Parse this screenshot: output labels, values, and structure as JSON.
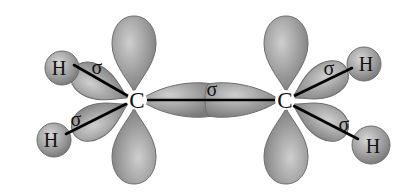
{
  "diagram": {
    "atoms": {
      "carbon_left": "C",
      "carbon_right": "C",
      "h_left_top": "H",
      "h_left_bottom": "H",
      "h_right_top": "H",
      "h_right_bottom": "H"
    },
    "bond_labels": {
      "sigma_left_top": "σ",
      "sigma_left_bottom": "σ",
      "sigma_cc": "σ",
      "sigma_right_top": "σ",
      "sigma_right_bottom": "σ"
    },
    "colors": {
      "lobe_fill": "#9a9a9a",
      "lobe_highlight": "#c8c8c8",
      "lobe_stroke": "#6e6e6e",
      "bond_line": "#000000",
      "background": "#ffffff"
    }
  }
}
